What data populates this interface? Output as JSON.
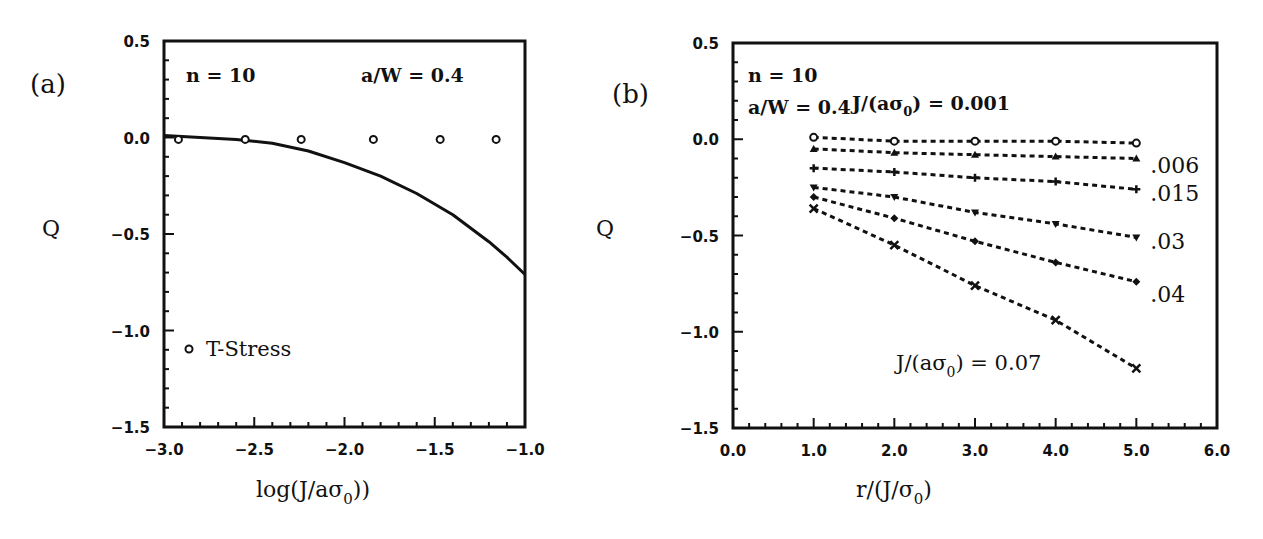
{
  "chart_data": [
    {
      "panel": "(a)",
      "type": "line",
      "title": "",
      "xlabel": "log(J/aσ0)",
      "ylabel": "Q",
      "xlim": [
        -3.0,
        -1.0
      ],
      "ylim": [
        -1.5,
        0.5
      ],
      "xticks": [
        "-3.0",
        "-2.5",
        "-2.0",
        "-1.5",
        "-1.0"
      ],
      "yticks": [
        "0.5",
        "0.0",
        "-0.5",
        "-1.0",
        "-1.5"
      ],
      "grid": false,
      "annotations": [
        "n = 10",
        "a/W = 0.4"
      ],
      "legend": [
        {
          "marker": "circle",
          "label": "T-Stress"
        }
      ],
      "series": [
        {
          "name": "Q (full field)",
          "style": "solid line",
          "x": [
            -3.0,
            -2.8,
            -2.6,
            -2.4,
            -2.2,
            -2.0,
            -1.8,
            -1.6,
            -1.4,
            -1.2,
            -1.1,
            -1.0
          ],
          "y": [
            0.01,
            0.0,
            -0.01,
            -0.03,
            -0.07,
            -0.13,
            -0.2,
            -0.29,
            -0.4,
            -0.54,
            -0.62,
            -0.71
          ]
        },
        {
          "name": "T-Stress",
          "style": "circle markers",
          "x": [
            -2.92,
            -2.55,
            -2.24,
            -1.84,
            -1.47,
            -1.16
          ],
          "y": [
            -0.01,
            -0.01,
            -0.01,
            -0.01,
            -0.01,
            -0.01
          ]
        }
      ]
    },
    {
      "panel": "(b)",
      "type": "line",
      "title": "",
      "xlabel": "r/(J/σ0)",
      "ylabel": "Q",
      "xlim": [
        0.0,
        6.0
      ],
      "ylim": [
        -1.5,
        0.5
      ],
      "xticks": [
        "0.0",
        "1.0",
        "2.0",
        "3.0",
        "4.0",
        "5.0",
        "6.0"
      ],
      "yticks": [
        "0.5",
        "0.0",
        "-0.5",
        "-1.0",
        "-1.5"
      ],
      "grid": false,
      "annotations": [
        "n = 10",
        "a/W = 0.4",
        "J/(aσ0) = 0.001",
        "J/(aσ0) = 0.07"
      ],
      "x": [
        1,
        2,
        3,
        4,
        5
      ],
      "series": [
        {
          "name": "J/(aσ0) = 0.001",
          "label": "",
          "marker": "circle",
          "values": [
            0.01,
            -0.01,
            -0.01,
            -0.01,
            -0.02
          ]
        },
        {
          "name": "J/(aσ0) = 0.006",
          "label": ".006",
          "marker": "triangle-up",
          "values": [
            -0.05,
            -0.07,
            -0.08,
            -0.09,
            -0.1
          ]
        },
        {
          "name": "J/(aσ0) = 0.015",
          "label": ".015",
          "marker": "plus",
          "values": [
            -0.15,
            -0.17,
            -0.2,
            -0.22,
            -0.26
          ]
        },
        {
          "name": "J/(aσ0) = 0.03",
          "label": ".03",
          "marker": "triangle-down",
          "values": [
            -0.25,
            -0.3,
            -0.38,
            -0.44,
            -0.51
          ]
        },
        {
          "name": "J/(aσ0) = 0.04",
          "label": ".04",
          "marker": "diamond",
          "values": [
            -0.3,
            -0.41,
            -0.53,
            -0.64,
            -0.74
          ]
        },
        {
          "name": "J/(aσ0) = 0.07",
          "label": "",
          "marker": "x",
          "values": [
            -0.36,
            -0.55,
            -0.76,
            -0.94,
            -1.19
          ]
        }
      ]
    }
  ],
  "panels": {
    "a": {
      "label": "(a)",
      "ylabel": "Q",
      "annot_n": "n = 10",
      "annot_aw": "a/W = 0.4",
      "legend_label": "T-Stress",
      "xlabel_main": "log(J/aσ",
      "xlabel_sub": "0",
      "xlabel_end": "))"
    },
    "b": {
      "label": "(b)",
      "ylabel": "Q",
      "annot_n": "n = 10",
      "annot_aw": "a/W = 0.4",
      "annot_top_pre": "J/(aσ",
      "annot_top_sub": "0",
      "annot_top_post": ") = 0.001",
      "annot_bottom_pre": "J/(aσ",
      "annot_bottom_sub": "0",
      "annot_bottom_post": ") = 0.07",
      "xlabel_main": "r/(J/σ",
      "xlabel_sub": "0",
      "xlabel_end": ")"
    }
  }
}
